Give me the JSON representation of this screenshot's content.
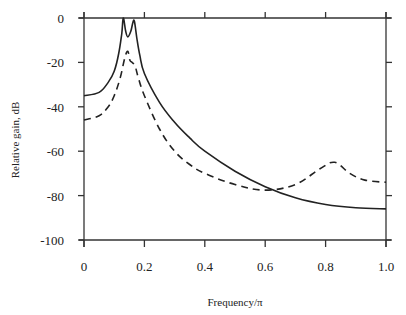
{
  "chart_data": {
    "type": "line",
    "title": "",
    "xlabel": "Frequency/π",
    "ylabel": "Relative gain, dB",
    "xlim": [
      0,
      1.0
    ],
    "ylim": [
      -100,
      0
    ],
    "xticks": [
      "0",
      "0.2",
      "0.4",
      "0.6",
      "0.8",
      "1.0"
    ],
    "yticks": [
      "0",
      "-20",
      "-40",
      "-60",
      "-80",
      "-100"
    ],
    "grid": false,
    "legend": null,
    "series": [
      {
        "name": "solid",
        "style": "solid",
        "color": "#222222",
        "x": [
          0,
          0.05,
          0.08,
          0.1,
          0.115,
          0.125,
          0.13,
          0.138,
          0.145,
          0.155,
          0.162,
          0.167,
          0.175,
          0.185,
          0.2,
          0.25,
          0.3,
          0.35,
          0.4,
          0.5,
          0.6,
          0.7,
          0.8,
          0.9,
          1.0
        ],
        "y": [
          -35,
          -33.5,
          -29,
          -24,
          -16,
          -7,
          0,
          -6,
          -8.5,
          -6,
          -2,
          -1.5,
          -9,
          -17,
          -25,
          -38,
          -47,
          -54,
          -60,
          -69,
          -76,
          -81,
          -84,
          -85.5,
          -86
        ]
      },
      {
        "name": "dashed",
        "style": "dashed",
        "color": "#222222",
        "x": [
          0,
          0.05,
          0.08,
          0.1,
          0.12,
          0.135,
          0.145,
          0.152,
          0.16,
          0.17,
          0.18,
          0.2,
          0.25,
          0.3,
          0.35,
          0.4,
          0.5,
          0.6,
          0.7,
          0.78,
          0.83,
          0.88,
          0.93,
          1.0
        ],
        "y": [
          -46,
          -44,
          -40,
          -35,
          -27,
          -18,
          -15,
          -19,
          -20,
          -22,
          -27,
          -35,
          -50,
          -60,
          -66,
          -70,
          -75,
          -77.5,
          -75,
          -68,
          -65,
          -70,
          -73,
          -74
        ]
      }
    ]
  }
}
